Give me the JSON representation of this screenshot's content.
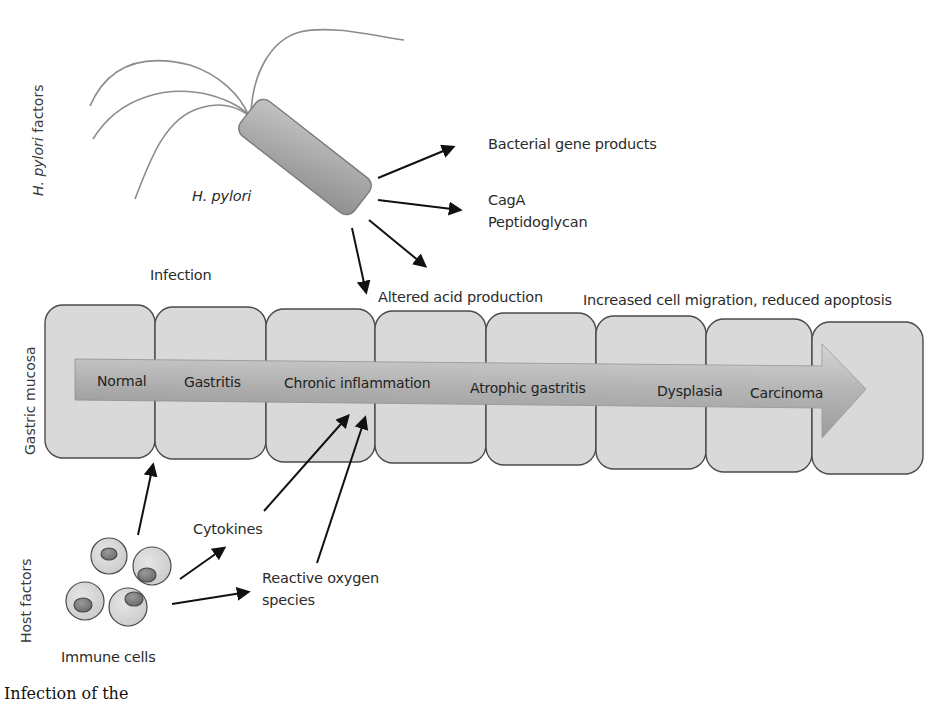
{
  "axis_labels": {
    "pathogen": {
      "prefix": "H. pylori",
      "suffix": " factors"
    },
    "tissue": "Gastric mucosa",
    "host": "Host factors"
  },
  "bacterium": {
    "label": "H. pylori",
    "products": {
      "gene_products": "Bacterial gene products",
      "cagA": "CagA",
      "peptidoglycan": "Peptidoglycan",
      "acid": "Altered acid production"
    }
  },
  "process_labels": {
    "infection": "Infection",
    "migration": "Increased cell migration, reduced apoptosis"
  },
  "progression": {
    "stages": [
      {
        "name": "Normal"
      },
      {
        "name": "Gastritis"
      },
      {
        "name": "Chronic inflammation"
      },
      {
        "name": "Atrophic gastritis"
      },
      {
        "name": "Dysplasia"
      },
      {
        "name": "Carcinoma"
      }
    ]
  },
  "host": {
    "cells_label": "Immune cells",
    "cytokines": "Cytokines",
    "ros_line1": "Reactive oxygen",
    "ros_line2": "species"
  },
  "caption": "Infection of the",
  "colors": {
    "cell_fill": "#d9d9d9",
    "cell_stroke": "#4a4a4a",
    "arrow_band_light": "#c8c8c8",
    "arrow_band_dark": "#8a8a8a",
    "bacterium_fill": "#a9a9a9",
    "flagella": "#8c8c8c",
    "arrow": "#111111"
  }
}
